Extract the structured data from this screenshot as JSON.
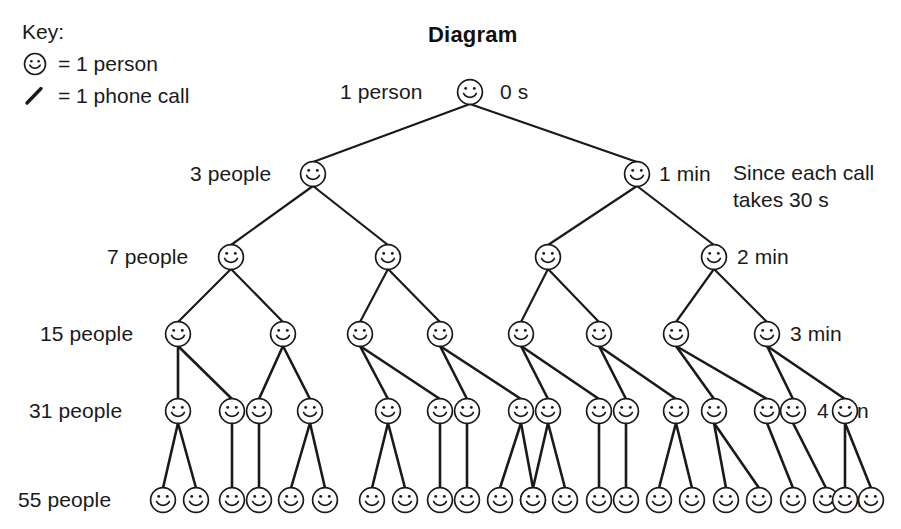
{
  "title": "Diagram",
  "key": {
    "heading": "Key:",
    "entries": [
      {
        "icon": "smiley-face-icon",
        "text": "= 1 person"
      },
      {
        "icon": "diagonal-line-icon",
        "text": "= 1 phone call"
      }
    ]
  },
  "note": "Since each call\ntakes 30 s",
  "root": {
    "left_label": "1 person",
    "right_label": "0 s"
  },
  "rows": [
    {
      "people_label": "1 person",
      "time_label": "0 s",
      "count": 1
    },
    {
      "people_label": "3 people",
      "time_label": "1 min",
      "count": 2
    },
    {
      "people_label": "7 people",
      "time_label": "2 min",
      "count": 4
    },
    {
      "people_label": "15 people",
      "time_label": "3 min",
      "count": 8
    },
    {
      "people_label": "31 people",
      "time_label": "4 min",
      "count": 16
    },
    {
      "people_label": "55 people",
      "time_label": "5 min",
      "count": 24
    }
  ],
  "chart_data": {
    "type": "diagram",
    "title": "Diagram",
    "categories": [
      "0 s",
      "1 min",
      "2 min",
      "3 min",
      "4 min",
      "5 min"
    ],
    "cumulative_people": [
      1,
      3,
      7,
      15,
      31,
      55
    ],
    "nodes_per_row": [
      1,
      2,
      4,
      8,
      16,
      24
    ],
    "call_duration_seconds": 30,
    "legend": [
      "smiley = 1 person",
      "line = 1 phone call"
    ]
  },
  "geometry": {
    "row_y": [
      92,
      174,
      257,
      334,
      411,
      500
    ],
    "node_r": 13,
    "rows_x": [
      [
        470
      ],
      [
        313,
        637
      ],
      [
        231,
        388,
        548,
        714
      ],
      [
        178,
        283,
        360,
        440,
        521,
        599,
        676,
        767
      ],
      [
        178,
        232,
        259,
        310,
        388,
        440,
        467,
        521,
        548,
        599,
        626,
        676,
        714,
        767,
        793,
        845
      ],
      [
        163,
        196,
        232,
        259,
        291,
        325,
        372,
        405,
        440,
        467,
        500,
        533,
        533,
        565,
        599,
        626,
        659,
        692,
        726,
        759,
        793,
        826,
        845,
        871
      ]
    ]
  }
}
